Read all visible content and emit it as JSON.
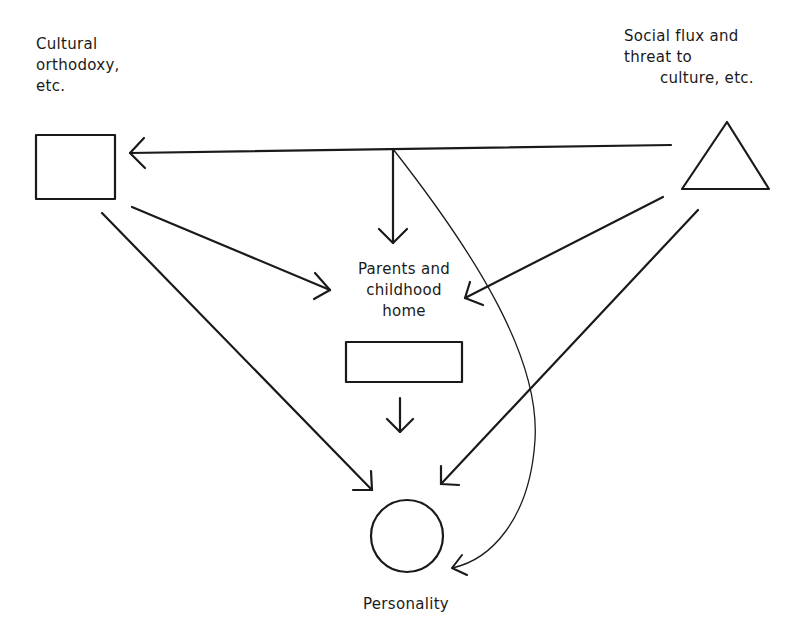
{
  "diagram": {
    "nodes": [
      {
        "id": "culture",
        "shape": "rectangle",
        "label_lines": [
          "Cultural",
          "orthodoxy,",
          "etc."
        ]
      },
      {
        "id": "social",
        "shape": "triangle",
        "label_lines": [
          "Social flux and",
          "threat to",
          "culture, etc."
        ]
      },
      {
        "id": "parents",
        "shape": "rectangle",
        "label_lines": [
          "Parents and",
          "childhood",
          "home"
        ]
      },
      {
        "id": "personality",
        "shape": "circle",
        "label_lines": [
          "Personality"
        ]
      }
    ],
    "edges": [
      {
        "from": "social",
        "to": "culture",
        "style": "straight"
      },
      {
        "from": "social",
        "to": "parents",
        "style": "straight",
        "via": "junction-down"
      },
      {
        "from": "social",
        "to": "personality",
        "style": "curved",
        "via": "junction"
      },
      {
        "from": "culture",
        "to": "parents",
        "style": "straight"
      },
      {
        "from": "culture",
        "to": "personality",
        "style": "straight"
      },
      {
        "from": "social",
        "to": "parents",
        "style": "straight"
      },
      {
        "from": "social",
        "to": "personality",
        "style": "straight"
      },
      {
        "from": "parents",
        "to": "personality",
        "style": "straight"
      }
    ],
    "colors": {
      "stroke": "#1a1a1a",
      "background": "#ffffff"
    }
  }
}
